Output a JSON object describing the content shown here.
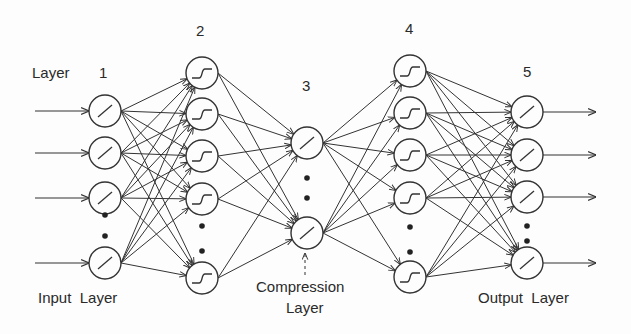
{
  "labels": {
    "layer_word": "Layer",
    "input_layer": "Input  Layer",
    "compression_line1": "Compression",
    "compression_line2": "Layer",
    "output_layer": "Output  Layer"
  },
  "layers": [
    {
      "number": "1",
      "activation": "linear",
      "visible_nodes": 4,
      "ellipsis_after": 3,
      "role": "input"
    },
    {
      "number": "2",
      "activation": "sigmoid",
      "visible_nodes": 5,
      "ellipsis_after": 4,
      "role": "hidden"
    },
    {
      "number": "3",
      "activation": "linear",
      "visible_nodes": 2,
      "ellipsis_after": 1,
      "role": "compression"
    },
    {
      "number": "4",
      "activation": "sigmoid",
      "visible_nodes": 5,
      "ellipsis_after": 4,
      "role": "hidden"
    },
    {
      "number": "5",
      "activation": "linear",
      "visible_nodes": 4,
      "ellipsis_after": 3,
      "role": "output"
    }
  ],
  "connectivity": "fully-connected between adjacent layers",
  "colors": {
    "ink": "#333333",
    "background": "#fdfdfd"
  }
}
